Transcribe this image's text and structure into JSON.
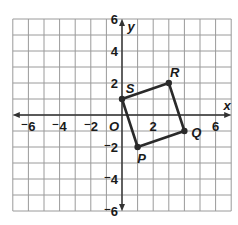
{
  "grid": {
    "x_min": -7,
    "x_max": 7,
    "y_min": -6,
    "y_max": 6,
    "origin_px": [
      122,
      115
    ],
    "unit_x_px": 15.6,
    "unit_y_px": 16,
    "line_color": "#9a9a9a",
    "axis_color": "#333333"
  },
  "axes": {
    "x_label": "x",
    "y_label": "y",
    "origin_label": "O",
    "x_ticks": [
      {
        "value": -6,
        "label": "⁻6"
      },
      {
        "value": -4,
        "label": "⁻4"
      },
      {
        "value": -2,
        "label": "⁻2"
      },
      {
        "value": 2,
        "label": "2"
      },
      {
        "value": 6,
        "label": "6"
      }
    ],
    "y_ticks": [
      {
        "value": 6,
        "label": "6"
      },
      {
        "value": 4,
        "label": "4"
      },
      {
        "value": 2,
        "label": "2"
      },
      {
        "value": -2,
        "label": "⁻2"
      },
      {
        "value": -4,
        "label": "⁻4"
      },
      {
        "value": -6,
        "label": "⁻6"
      }
    ]
  },
  "quadrilateral": {
    "name": "PQRS",
    "stroke": "#2a2a2a",
    "vertices": [
      {
        "label": "P",
        "x": 1,
        "y": -2
      },
      {
        "label": "Q",
        "x": 4,
        "y": -1
      },
      {
        "label": "R",
        "x": 3,
        "y": 2
      },
      {
        "label": "S",
        "x": 0,
        "y": 1
      }
    ]
  }
}
